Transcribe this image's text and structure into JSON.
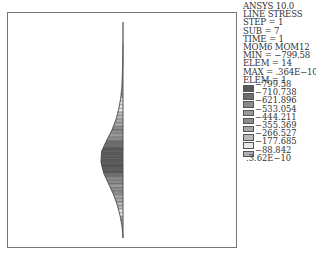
{
  "info": {
    "lines": [
      "ANSYS 10.0",
      "LINE STRESS",
      "STEP = 1",
      "SUB = 7",
      "TIME = 1",
      "MOM6 MOM12",
      "MIN = −799.58",
      "ELEM = 14",
      "MAX = .364E−10",
      "ELEM = 1"
    ]
  },
  "legend": {
    "swatches": [
      "#5a5a5a",
      "#6e6e6e",
      "#8a8a8a",
      "#9a9a9a",
      "#8c8c8c",
      "#a6a6a6",
      "#b8b8b8",
      "#e8e8e8",
      "#b0b0b0",
      "#7a7a7a"
    ],
    "labels": [
      "−799.58",
      "−710.738",
      "−621.896",
      "−533.054",
      "−444.211",
      "−355.369",
      "−266.527",
      "−177.685",
      "−88.842",
      ".3.62E−10"
    ]
  },
  "chart_data": {
    "type": "area",
    "title": "ANSYS 10.0 LINE STRESS",
    "subtitle": "STEP=1 SUB=7 TIME=1 MOM6 MOM12",
    "orientation": "vertical-line-with-leftward-distribution",
    "min": {
      "value": -799.58,
      "elem": 14
    },
    "max": {
      "value": 3.64e-11,
      "elem": 1
    },
    "legend_levels": [
      -799.58,
      -710.738,
      -621.896,
      -533.054,
      -444.211,
      -355.369,
      -266.527,
      -177.685,
      -88.842,
      3.62e-10
    ],
    "profile": {
      "description": "Bell-shaped moment distribution along vertical line, peak near 60% of height",
      "y_fraction": [
        0.0,
        0.1,
        0.2,
        0.3,
        0.35,
        0.4,
        0.45,
        0.5,
        0.55,
        0.6,
        0.65,
        0.7,
        0.75,
        0.8,
        0.85,
        0.9,
        0.95,
        1.0
      ],
      "magnitude": [
        0,
        0,
        10,
        40,
        80,
        150,
        250,
        400,
        600,
        780,
        799.58,
        700,
        520,
        340,
        200,
        100,
        30,
        0
      ]
    },
    "grid": false,
    "legend_position": "right"
  }
}
